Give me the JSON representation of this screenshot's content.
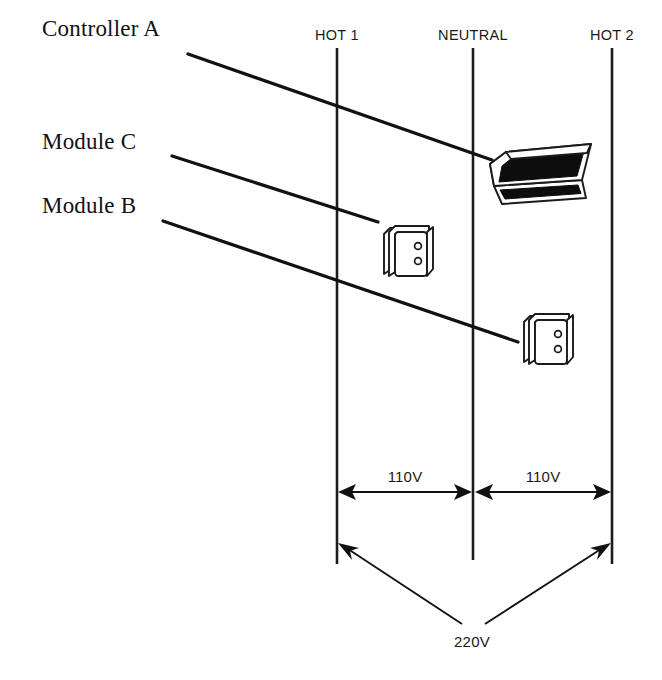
{
  "diagram": {
    "bus_lines": [
      {
        "id": "hot1",
        "label": "HOT 1",
        "x": 337,
        "label_x": 337,
        "label_y": 40,
        "y_top": 48,
        "y_bottom": 564
      },
      {
        "id": "neutral",
        "label": "NEUTRAL",
        "x": 473,
        "label_x": 473,
        "label_y": 40,
        "y_top": 48,
        "y_bottom": 560
      },
      {
        "id": "hot2",
        "label": "HOT 2",
        "x": 612,
        "label_x": 612,
        "label_y": 40,
        "y_top": 48,
        "y_bottom": 564
      }
    ],
    "callouts": [
      {
        "id": "controller-a",
        "label": "Controller A",
        "label_x": 42,
        "label_y": 36,
        "leader": {
          "x1": 188,
          "y1": 54,
          "x2": 492,
          "y2": 160
        }
      },
      {
        "id": "module-c",
        "label": "Module C",
        "label_x": 42,
        "label_y": 149,
        "leader": {
          "x1": 172,
          "y1": 156,
          "x2": 378,
          "y2": 222
        }
      },
      {
        "id": "module-b",
        "label": "Module B",
        "label_x": 42,
        "label_y": 213,
        "leader": {
          "x1": 163,
          "y1": 221,
          "x2": 518,
          "y2": 342
        }
      }
    ],
    "devices": [
      {
        "id": "controller-a-device",
        "type": "controller-console",
        "x": 490,
        "y": 142
      },
      {
        "id": "module-c-device",
        "type": "outlet-module",
        "x": 381,
        "y": 224
      },
      {
        "id": "module-b-device",
        "type": "outlet-module",
        "x": 521,
        "y": 312
      }
    ],
    "measurements": [
      {
        "id": "voltage-hot1-neutral",
        "value": "110V",
        "text_x": 405,
        "text_y": 482,
        "line_y": 492,
        "x_from": 339,
        "x_to": 471
      },
      {
        "id": "voltage-neutral-hot2",
        "value": "110V",
        "text_x": 543,
        "text_y": 482,
        "line_y": 492,
        "x_from": 476,
        "x_to": 610
      },
      {
        "id": "voltage-hot1-hot2",
        "value": "220V",
        "text_x": 472,
        "text_y": 647,
        "apex_x": 472,
        "apex_y": 628,
        "left_x": 339,
        "left_y": 543,
        "right_x": 610,
        "right_y": 543
      }
    ],
    "colors": {
      "line": "#1b1b1b",
      "text": "#111111",
      "device_dark": "#0d0d0d",
      "background": "#ffffff"
    }
  }
}
